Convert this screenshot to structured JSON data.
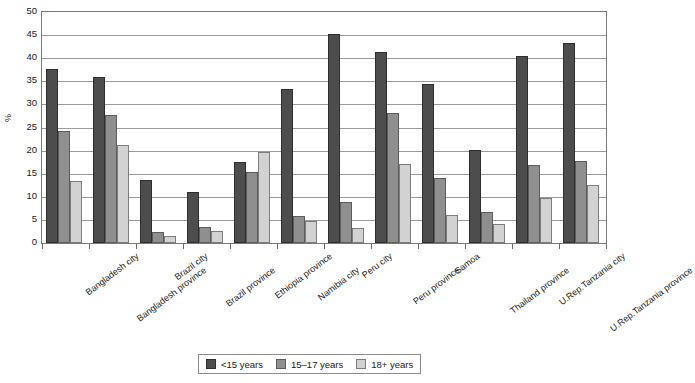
{
  "chart_data": {
    "type": "bar",
    "title": "",
    "subtitle": "",
    "xlabel": "",
    "ylabel": "%",
    "ylim": [
      0,
      50
    ],
    "ytick_step": 5,
    "yticks": [
      50,
      45,
      40,
      35,
      30,
      25,
      20,
      15,
      10,
      5,
      0
    ],
    "grid": true,
    "legend_position": "bottom-center",
    "categories": [
      "Bangladesh city",
      "Bangladesh province",
      "Brazil city",
      "Brazil province",
      "Ethiopia province",
      "Namibia city",
      "Peru city",
      "Peru province",
      "Samoa",
      "Thailand province",
      "U.Rep.Tanzania city",
      "U.Rep.Tanzania province"
    ],
    "series": [
      {
        "name": "<15 years",
        "color": "#4d4d4d",
        "values": [
          37.6,
          35.9,
          13.7,
          11.1,
          17.6,
          33.4,
          45.2,
          41.4,
          34.4,
          20.1,
          40.4,
          43.4
        ]
      },
      {
        "name": "15–17 years",
        "color": "#8f8f8f",
        "values": [
          24.2,
          27.7,
          2.3,
          3.5,
          15.4,
          5.9,
          8.8,
          28.2,
          14.0,
          6.8,
          16.9,
          17.8
        ]
      },
      {
        "name": "18+ years",
        "color": "#d2d2d2",
        "values": [
          13.5,
          21.3,
          1.6,
          2.6,
          19.6,
          4.7,
          3.2,
          17.0,
          6.1,
          4.1,
          9.8,
          12.6
        ]
      }
    ]
  },
  "legend": {
    "items": [
      {
        "label": "<15 years"
      },
      {
        "label": "15–17 years"
      },
      {
        "label": "18+ years"
      }
    ]
  },
  "axis": {
    "y_title": "%"
  }
}
